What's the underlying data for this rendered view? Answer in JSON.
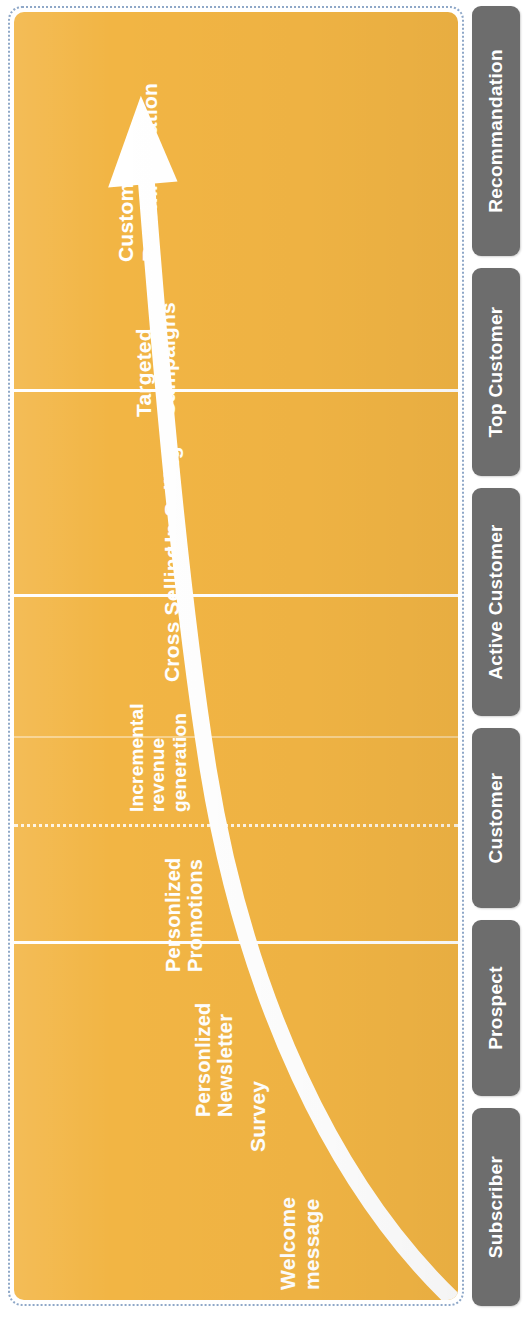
{
  "diagram": {
    "type": "customer-journey-funnel",
    "orientation": "vertical-rotated",
    "colors": {
      "panel_fill": "#f2b544",
      "panel_border": "#8fa8c8",
      "arrow": "#ffffff",
      "divider": "#ffffff",
      "chip_fill": "#6d6d6d",
      "chip_text": "#ffffff",
      "label_text": "#ffffff"
    }
  },
  "stages": [
    {
      "id": "customer-recommandation",
      "label": "Customer\nRecommandation",
      "font_size": 21,
      "x": 100,
      "y": 250,
      "divider_top": null
    },
    {
      "id": "targeted-campaigns",
      "label": "Targeted\nCampaigns",
      "font_size": 21,
      "x": 118,
      "y": 405,
      "divider_top": 383
    },
    {
      "id": "up-selling",
      "label": "Up-Selling",
      "font_size": 21,
      "x": 146,
      "y": 540,
      "divider_top": null
    },
    {
      "id": "cross-selling",
      "label": "Cross Selling",
      "font_size": 21,
      "x": 146,
      "y": 670,
      "divider_top": 588
    },
    {
      "id": "incremental-revenue-generation",
      "label": "Incremental\nrevenue\ngeneration",
      "font_size": 19,
      "x": 112,
      "y": 800,
      "divider_top": 730
    },
    {
      "id": "personlized-promotions",
      "label": "Personlized\nPromotions",
      "font_size": 20,
      "x": 148,
      "y": 960,
      "divider_top": 818
    },
    {
      "id": "personlized-newsletter",
      "label": "Personlized\nNewsletter",
      "font_size": 20,
      "x": 178,
      "y": 1105,
      "divider_top": 935
    },
    {
      "id": "survey",
      "label": "Survey",
      "font_size": 21,
      "x": 232,
      "y": 1140,
      "divider_top": null
    },
    {
      "id": "welcome-message",
      "label": "Welcome\nmessage",
      "font_size": 21,
      "x": 262,
      "y": 1278,
      "divider_top": null
    }
  ],
  "segments": [
    {
      "id": "recommandation",
      "label": "Recommandation",
      "top": 6,
      "height": 250
    },
    {
      "id": "top-customer",
      "label": "Top Customer",
      "top": 268,
      "height": 208
    },
    {
      "id": "active-customer",
      "label": "Active Customer",
      "top": 488,
      "height": 228
    },
    {
      "id": "customer",
      "label": "Customer",
      "top": 728,
      "height": 180
    },
    {
      "id": "prospect",
      "label": "Prospect",
      "top": 920,
      "height": 176
    },
    {
      "id": "subscriber",
      "label": "Subscriber",
      "top": 1108,
      "height": 198
    }
  ]
}
